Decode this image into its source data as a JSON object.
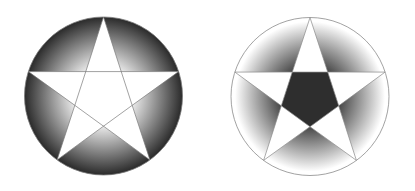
{
  "figure": {
    "panels": [
      {
        "name": "left-pentagram",
        "star_fill": "#ffffff",
        "shade_inner": "#f4f4f4",
        "shade_outer": "#2a2a2a",
        "stroke": "#7a7a7a",
        "style": "outer-regions-dark-at-rim"
      },
      {
        "name": "right-pentagram",
        "star_fill": "#ffffff",
        "shade_inner": "#2c2c2c",
        "shade_outer": "#ffffff",
        "center_pentagon_fill": "#2e2e2e",
        "stroke": "#8a8a8a",
        "style": "outer-regions-dark-near-center"
      }
    ]
  }
}
